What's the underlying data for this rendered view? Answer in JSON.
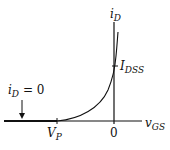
{
  "diagram": {
    "y_axis": {
      "label_main": "i",
      "label_sub": "D"
    },
    "x_axis": {
      "label_main": "v",
      "label_sub": "GS"
    },
    "idss": {
      "label_main": "I",
      "label_sub": "DSS"
    },
    "vp": {
      "label_main": "V",
      "label_sub": "P"
    },
    "origin": {
      "label": "0"
    },
    "annotation": {
      "label_main": "i",
      "label_sub": "D",
      "label_rest": " = 0"
    },
    "colors": {
      "stroke": "#111111",
      "background": "#ffffff"
    }
  }
}
